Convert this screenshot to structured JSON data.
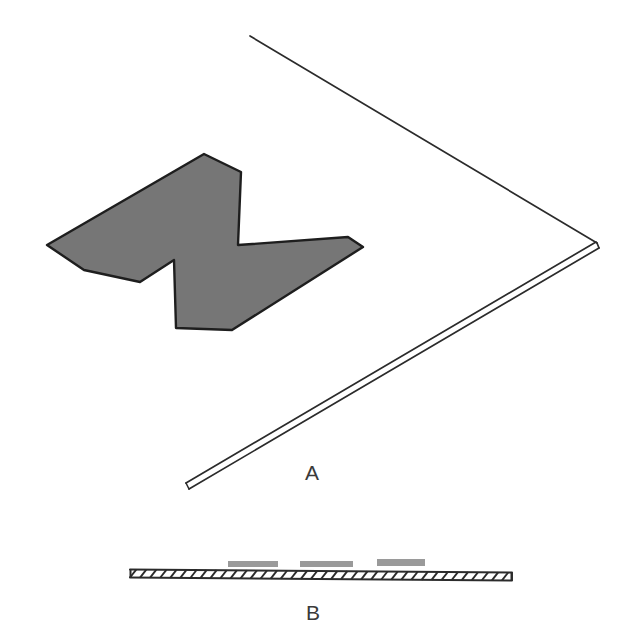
{
  "figure": {
    "background_color": "#ffffff",
    "stroke_color": "#2b2b2b",
    "panels": [
      {
        "id": "A",
        "label": "A",
        "label_position": {
          "x": 305,
          "y": 462
        },
        "description": "perspective view of thin plate with zigzag gray region"
      },
      {
        "id": "B",
        "label": "B",
        "label_position": {
          "x": 306,
          "y": 602
        },
        "description": "edge-on hatched cross-section with three gray patches"
      }
    ],
    "panel_a": {
      "plate_outline": {
        "stroke": "#2b2b2b",
        "stroke_width": 1.6,
        "top_edge": {
          "from": {
            "x": 250,
            "y": 36
          },
          "to": {
            "x": 597,
            "y": 243
          }
        },
        "bottom_edge": {
          "from": {
            "x": 597,
            "y": 243
          },
          "to": {
            "x": 188,
            "y": 485
          }
        },
        "thickness_offset_px": 4
      },
      "zigzag_shape": {
        "name": "M-shaped gray region",
        "fill": "#767676",
        "stroke": "#1e1e1e",
        "stroke_width": 2.2,
        "points": [
          {
            "x": 47,
            "y": 245
          },
          {
            "x": 204,
            "y": 154
          },
          {
            "x": 241,
            "y": 172
          },
          {
            "x": 238,
            "y": 245
          },
          {
            "x": 348,
            "y": 237
          },
          {
            "x": 363,
            "y": 247
          },
          {
            "x": 232,
            "y": 330
          },
          {
            "x": 176,
            "y": 328
          },
          {
            "x": 174,
            "y": 260
          },
          {
            "x": 140,
            "y": 282
          },
          {
            "x": 84,
            "y": 270
          }
        ]
      }
    },
    "panel_b": {
      "cross_section_bar": {
        "name": "hatched plate cross-section",
        "x_start": 130,
        "x_end": 512,
        "y_top": 570,
        "y_bottom": 580,
        "stroke": "#2b2b2b",
        "hatch_count": 38,
        "hatch_direction": "diagonal"
      },
      "patches": [
        {
          "id": "patch-1",
          "x": 228,
          "y": 561,
          "width": 50,
          "height": 6,
          "fill": "#9a9a9a"
        },
        {
          "id": "patch-2",
          "x": 300,
          "y": 561,
          "width": 53,
          "height": 6,
          "fill": "#9a9a9a"
        },
        {
          "id": "patch-3",
          "x": 377,
          "y": 559,
          "width": 48,
          "height": 7,
          "fill": "#9a9a9a"
        }
      ]
    },
    "colors": {
      "gray_fill": "#767676",
      "patch_gray": "#9a9a9a",
      "line": "#2b2b2b",
      "label_text": "#3a3a3a"
    }
  }
}
